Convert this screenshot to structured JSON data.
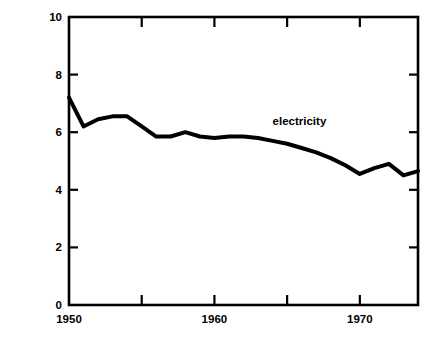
{
  "chart_data": {
    "type": "line",
    "title": "",
    "subtitle": "",
    "xlabel": "",
    "ylabel": "1970 DOLLARS PER MILLION BTU",
    "xlim": [
      1950,
      1974
    ],
    "ylim": [
      0,
      10
    ],
    "grid": false,
    "legend_position": "inline-annotation",
    "y_ticks": [
      0,
      2,
      4,
      6,
      8,
      10
    ],
    "y_tick_labels": [
      "0",
      "2",
      "4",
      "6",
      "8",
      "10"
    ],
    "x_ticks": [
      1950,
      1955,
      1960,
      1965,
      1970
    ],
    "x_tick_labels": [
      "1950",
      "",
      "1960",
      "",
      "1970"
    ],
    "x_major_labels": [
      "1950",
      "1960",
      "1970"
    ],
    "annotations": [
      {
        "text": "electricity",
        "x": 1964,
        "y": 6.35
      }
    ],
    "series": [
      {
        "name": "electricity",
        "color": "#000000",
        "line_width": 4,
        "x": [
          1950,
          1951,
          1952,
          1953,
          1954,
          1955,
          1956,
          1957,
          1958,
          1959,
          1960,
          1961,
          1962,
          1963,
          1964,
          1965,
          1966,
          1967,
          1968,
          1969,
          1970,
          1971,
          1972,
          1973,
          1974
        ],
        "values": [
          7.2,
          6.2,
          6.45,
          6.55,
          6.55,
          6.2,
          5.85,
          5.85,
          6.0,
          5.85,
          5.8,
          5.85,
          5.85,
          5.8,
          5.7,
          5.6,
          5.45,
          5.3,
          5.1,
          4.85,
          4.55,
          4.75,
          4.9,
          4.5,
          4.65
        ]
      }
    ]
  },
  "axes": {
    "y_axis_label": "1970 DOLLARS PER MILLION BTU"
  }
}
